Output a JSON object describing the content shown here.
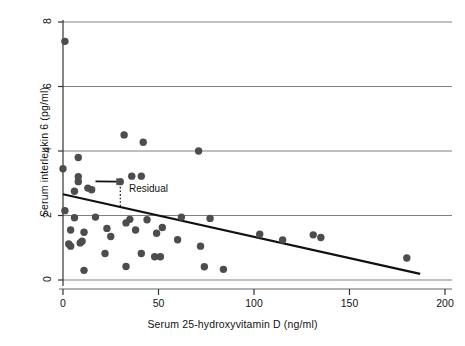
{
  "chart_data": {
    "type": "scatter",
    "title": "",
    "xlabel": "Serum 25-hydroxyvitamin D (ng/ml)",
    "ylabel": "Serum interleukin 6 (pg/ml)",
    "xlim": [
      0,
      200
    ],
    "ylim": [
      0,
      8
    ],
    "xticks": [
      0,
      50,
      100,
      150,
      200
    ],
    "yticks": [
      0,
      2,
      4,
      6,
      8
    ],
    "xticklabels": [
      "0",
      "50",
      "100",
      "150",
      "200"
    ],
    "yticklabels": [
      "0",
      "2",
      "4",
      "6",
      "8"
    ],
    "grid": "horizontal",
    "legend": "none",
    "marker_color": "#4d4d4d",
    "line_color": "#111111",
    "grid_color": "#808080",
    "points": [
      [
        1,
        7.4
      ],
      [
        8,
        3.8
      ],
      [
        0,
        3.45
      ],
      [
        8,
        3.2
      ],
      [
        8,
        3.05
      ],
      [
        13,
        2.85
      ],
      [
        15,
        2.8
      ],
      [
        6,
        2.75
      ],
      [
        30,
        3.05
      ],
      [
        36,
        3.22
      ],
      [
        41,
        3.22
      ],
      [
        32,
        4.5
      ],
      [
        42,
        4.27
      ],
      [
        71,
        4.0
      ],
      [
        1,
        2.15
      ],
      [
        6,
        1.93
      ],
      [
        17,
        1.95
      ],
      [
        35,
        1.88
      ],
      [
        44,
        1.87
      ],
      [
        62,
        1.95
      ],
      [
        77,
        1.91
      ],
      [
        4,
        1.55
      ],
      [
        11,
        1.48
      ],
      [
        23,
        1.6
      ],
      [
        33,
        1.77
      ],
      [
        38,
        1.55
      ],
      [
        52,
        1.63
      ],
      [
        49,
        1.45
      ],
      [
        3,
        1.12
      ],
      [
        4,
        1.05
      ],
      [
        10,
        1.2
      ],
      [
        9,
        1.15
      ],
      [
        25,
        1.35
      ],
      [
        60,
        1.25
      ],
      [
        72,
        1.05
      ],
      [
        103,
        1.42
      ],
      [
        115,
        1.24
      ],
      [
        131,
        1.4
      ],
      [
        135,
        1.32
      ],
      [
        180,
        0.68
      ],
      [
        22,
        0.82
      ],
      [
        41,
        0.82
      ],
      [
        48,
        0.72
      ],
      [
        51,
        0.72
      ],
      [
        33,
        0.42
      ],
      [
        74,
        0.41
      ],
      [
        84,
        0.33
      ],
      [
        11,
        0.3
      ]
    ],
    "regression_line": {
      "x0": 0,
      "y0": 2.66,
      "x1": 187,
      "y1": 0.19
    },
    "annotations": [
      {
        "name": "residual",
        "label": "Residual",
        "arrow_from": [
          17,
          3.06
        ],
        "arrow_to": [
          28,
          3.05
        ],
        "dotted_from": [
          30,
          3.0
        ],
        "dotted_to": [
          30,
          2.27
        ]
      }
    ]
  }
}
